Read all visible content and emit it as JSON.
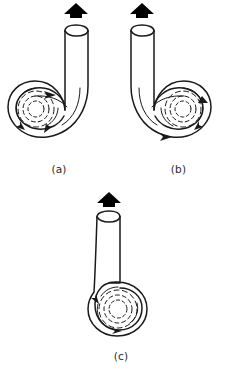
{
  "figure": {
    "background_color": "#ffffff",
    "stroke_color": "#1a1a1a",
    "arrow_fill_color": "#000000",
    "panel_count": 3
  },
  "panels": [
    {
      "id": "a",
      "label": "(a)",
      "description": "Spiral chamber at lower left with tube bending up and to the right, outlet at top right, flow arrow pointing up",
      "outlet_direction": "up",
      "spiral_position": "lower-left",
      "tube_orientation": "bend-right-up",
      "flow_arrow_label": "up-arrow",
      "dashed_circle_count": 3,
      "internal_flow_arrow_count": 4
    },
    {
      "id": "b",
      "label": "(b)",
      "description": "Spiral chamber at lower right with tube bending up and to the left, outlet at top left, flow arrow pointing up",
      "outlet_direction": "up",
      "spiral_position": "lower-right",
      "tube_orientation": "bend-left-up",
      "flow_arrow_label": "up-arrow",
      "dashed_circle_count": 3,
      "internal_flow_arrow_count": 4
    },
    {
      "id": "c",
      "label": "(c)",
      "description": "Spiral chamber at bottom with straight vertical tube rising from its right side, outlet at top, flow arrow pointing up",
      "outlet_direction": "up",
      "spiral_position": "bottom-center",
      "tube_orientation": "straight-vertical",
      "flow_arrow_label": "up-arrow",
      "dashed_circle_count": 3,
      "internal_flow_arrow_count": 3
    }
  ]
}
